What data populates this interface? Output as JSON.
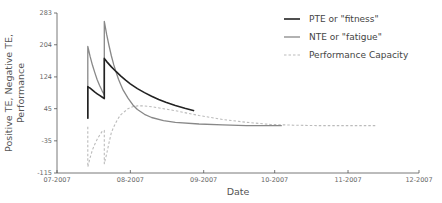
{
  "chart_data": {
    "type": "line",
    "title": "",
    "xlabel": "Date",
    "ylabel": "Positive TE, Negative TE, Performance",
    "ylabel_lines": [
      "Positive TE, Negative TE,",
      "Performance"
    ],
    "ylim": [
      -115,
      283
    ],
    "yticks": [
      -115,
      -35,
      45,
      124,
      204,
      283
    ],
    "ytick_labels": [
      "-115",
      "-35",
      "45",
      "124",
      "204",
      "283"
    ],
    "xlim": [
      "07-2007",
      "12-2007"
    ],
    "xticks": [
      "07-2007",
      "08-2007",
      "09-2007",
      "10-2007",
      "11-2007",
      "12-2007"
    ],
    "x_unit": "days since 2007-07-01",
    "xtick_days": [
      0,
      31,
      62,
      92,
      123,
      153
    ],
    "legend": {
      "position": "upper right",
      "entries": [
        {
          "label": "PTE or \"fitness\"",
          "style": "solid",
          "color": "#222222"
        },
        {
          "label": "NTE or \"fatigue\"",
          "style": "solid",
          "color": "#888888"
        },
        {
          "label": "Performance Capacity",
          "style": "dashed",
          "color": "#bbbbbb"
        }
      ]
    },
    "series": [
      {
        "name": "PTE or \"fitness\"",
        "color": "#222222",
        "style": "solid",
        "width": 1.6,
        "x": [
          13,
          13,
          13.5,
          14,
          15,
          16,
          17,
          18,
          19,
          20,
          20,
          20.5,
          21,
          23,
          25,
          27,
          29,
          31,
          34,
          37,
          40,
          43,
          46,
          50,
          54,
          58
        ],
        "y": [
          20,
          100,
          98,
          96,
          91,
          86,
          82,
          78,
          74,
          70,
          170,
          166,
          162,
          149,
          137,
          126,
          116,
          107,
          95,
          85,
          76,
          68,
          61,
          53,
          46,
          40
        ]
      },
      {
        "name": "NTE or \"fatigue\"",
        "color": "#888888",
        "style": "solid",
        "width": 1.3,
        "x": [
          13,
          13,
          14,
          15,
          16,
          17,
          18,
          19,
          20,
          20,
          21,
          22,
          23,
          24,
          25,
          26,
          27,
          28,
          30,
          32,
          34,
          37,
          40,
          45,
          50,
          60,
          70,
          80,
          90,
          95
        ],
        "y": [
          20,
          200,
          175,
          153,
          134,
          117,
          103,
          90,
          79,
          262,
          229,
          201,
          176,
          154,
          135,
          118,
          104,
          91,
          71,
          55,
          43,
          31,
          23,
          15,
          11,
          7,
          5,
          3,
          3,
          3
        ]
      },
      {
        "name": "Performance Capacity",
        "color": "#bbbbbb",
        "style": "dashed",
        "width": 1.1,
        "x": [
          13,
          13,
          14,
          15,
          16,
          17,
          18,
          19,
          20,
          20,
          21,
          22,
          23,
          24,
          25,
          26,
          27,
          28,
          30,
          32,
          34,
          37,
          40,
          45,
          50,
          55,
          60,
          70,
          80,
          90,
          100,
          110,
          120,
          130,
          135
        ],
        "y": [
          0,
          -100,
          -77,
          -57,
          -43,
          -31,
          -21,
          -12,
          -9,
          -92,
          -67,
          -39,
          -14,
          0,
          12,
          22,
          30,
          35,
          45,
          50,
          52,
          52,
          50,
          45,
          40,
          34,
          28,
          18,
          11,
          6,
          4,
          3,
          3,
          3,
          3
        ]
      }
    ]
  }
}
